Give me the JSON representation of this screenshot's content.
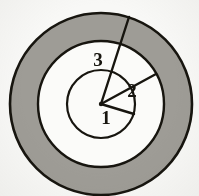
{
  "figure": {
    "canvas": {
      "width": 199,
      "height": 196
    },
    "background_color": "#f8f8f6",
    "stroke_color": "#17150f",
    "annulus_fill": "#9e9c96",
    "disc_fill": "#fbfbf9",
    "center": {
      "x": 101,
      "y": 104
    },
    "circles": [
      {
        "name": "outer-circle",
        "radius": 91,
        "fill": "#9e9c96",
        "stroke_width": 2.6
      },
      {
        "name": "middle-circle",
        "radius": 63,
        "fill": "#fbfbf9",
        "stroke_width": 2.4
      },
      {
        "name": "inner-circle",
        "radius": 34,
        "fill": "#fbfbf9",
        "stroke_width": 2.2
      }
    ],
    "radii": [
      {
        "label": "1",
        "name": "radius-segment-1",
        "ends_at": "inner-circle",
        "length": 34,
        "angle_deg": 17,
        "end_point": {
          "x": 134,
          "y": 114
        },
        "label_position": {
          "x": 106,
          "y": 124
        },
        "stroke_width": 2.4
      },
      {
        "label": "2",
        "name": "radius-segment-2",
        "ends_at": "middle-circle",
        "length": 63,
        "angle_deg": -29,
        "end_point": {
          "x": 156,
          "y": 74
        },
        "label_position": {
          "x": 132,
          "y": 97
        },
        "stroke_width": 2.4
      },
      {
        "label": "3",
        "name": "radius-segment-3",
        "ends_at": "outer-circle",
        "length": 91,
        "angle_deg": -72,
        "end_point": {
          "x": 129,
          "y": 17
        },
        "label_position": {
          "x": 98,
          "y": 66
        },
        "stroke_width": 2.4
      }
    ],
    "labels": [
      "1",
      "2",
      "3"
    ]
  }
}
